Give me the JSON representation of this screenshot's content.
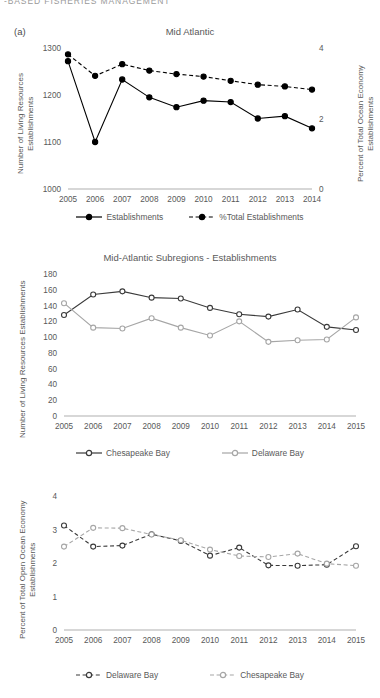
{
  "runhead": "-BASED FISHERIES MANAGEMENT",
  "figure": {
    "panel_label": "(a)"
  },
  "chart_data": [
    {
      "id": "mid-atlantic",
      "type": "line",
      "title": "Mid Atlantic",
      "panel": "(a)",
      "xlabel": "",
      "ylabel": "Number of Living Resources Establishments",
      "ylabel_right": "Percent of Total Ocean Economy Establishments",
      "categories": [
        "2005",
        "2006",
        "2007",
        "2008",
        "2009",
        "2010",
        "2011",
        "2012",
        "2013",
        "2014"
      ],
      "ylim": [
        1000,
        1300
      ],
      "yticks": [
        1000,
        1100,
        1200,
        1300
      ],
      "ylim_right": [
        0,
        4
      ],
      "yticks_right": [
        0,
        2,
        4
      ],
      "grid": false,
      "legend_position": "bottom",
      "series": [
        {
          "name": "Establishments",
          "axis": "left",
          "style": "solid",
          "marker": "filled-circle",
          "color": "#000000",
          "values": [
            1272,
            1100,
            1233,
            1195,
            1174,
            1188,
            1185,
            1150,
            1155,
            1129
          ]
        },
        {
          "name": "%Total Establishments",
          "axis": "right",
          "style": "dashed",
          "marker": "filled-circle",
          "color": "#000000",
          "values": [
            3.82,
            3.21,
            3.54,
            3.36,
            3.26,
            3.19,
            3.07,
            2.96,
            2.91,
            2.82
          ]
        }
      ]
    },
    {
      "id": "mid-atlantic-subregions-establishments",
      "type": "line",
      "title": "Mid-Atlantic Subregions - Establishments",
      "xlabel": "",
      "ylabel": "Number of Living Resources Establishments",
      "categories": [
        "2005",
        "2006",
        "2007",
        "2008",
        "2009",
        "2010",
        "2011",
        "2012",
        "2013",
        "2014",
        "2015"
      ],
      "ylim": [
        0,
        180
      ],
      "yticks": [
        0,
        20,
        40,
        60,
        80,
        100,
        120,
        140,
        160,
        180
      ],
      "grid": false,
      "legend_position": "bottom",
      "series": [
        {
          "name": "Chesapeake Bay",
          "style": "solid",
          "marker": "open-circle",
          "color": "#3a3a3a",
          "values": [
            128,
            154,
            158,
            150,
            149,
            137,
            129,
            126,
            135,
            113,
            109
          ]
        },
        {
          "name": "Delaware Bay",
          "style": "solid",
          "marker": "open-circle",
          "color": "#a6a6a6",
          "values": [
            143,
            112,
            111,
            124,
            112,
            102,
            120,
            94,
            96,
            97,
            125
          ]
        }
      ]
    },
    {
      "id": "mid-atlantic-subregions-percent",
      "type": "line",
      "title": "",
      "xlabel": "",
      "ylabel": "Percent of Total Open Ocean Economy Establishments",
      "categories": [
        "2005",
        "2006",
        "2007",
        "2008",
        "2009",
        "2010",
        "2011",
        "2012",
        "2013",
        "2014",
        "2015"
      ],
      "ylim": [
        0,
        4
      ],
      "yticks": [
        0,
        1,
        2,
        3,
        4
      ],
      "grid": false,
      "legend_position": "bottom",
      "series": [
        {
          "name": "Delaware Bay",
          "style": "dashed",
          "marker": "open-circle",
          "color": "#3a3a3a",
          "values": [
            3.12,
            2.49,
            2.52,
            2.86,
            2.66,
            2.22,
            2.46,
            1.93,
            1.92,
            1.95,
            2.5
          ]
        },
        {
          "name": "Chesapeake Bay",
          "style": "dashed",
          "marker": "open-circle",
          "color": "#a6a6a6",
          "values": [
            2.49,
            3.05,
            3.04,
            2.85,
            2.68,
            2.4,
            2.21,
            2.18,
            2.28,
            1.98,
            1.92
          ]
        }
      ]
    }
  ]
}
